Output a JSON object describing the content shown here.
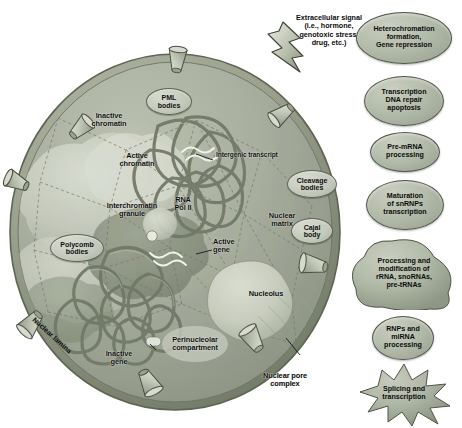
{
  "figure": {
    "background_color": "#ffffff"
  },
  "signal": {
    "icon": "lightning-bolt-icon",
    "text": "Extracellular signal\n(i.e., hormone,\ngenotoxic stress,\ndrug, etc.)"
  },
  "nucleus": {
    "membrane_color": "#8d9584",
    "interior_color": "#a9b09e",
    "labels": [
      {
        "id": "inactive-chromatin",
        "text": "Inactive\nchromatin"
      },
      {
        "id": "active-chromatin",
        "text": "Active\nchromatin"
      },
      {
        "id": "interchromatin-granule",
        "text": "Interchromatin\ngranule"
      },
      {
        "id": "intergenic-transcript",
        "text": "Intergenic transcript"
      },
      {
        "id": "rna-pol-ii",
        "text": "RNA\nPol II"
      },
      {
        "id": "active-gene",
        "text": "Active\ngene"
      },
      {
        "id": "nuclear-matrix",
        "text": "Nuclear\nmatrix"
      },
      {
        "id": "nucleolus",
        "text": "Nucleolus"
      },
      {
        "id": "perinucleolar-compartment",
        "text": "Perinucleolar\ncompartment"
      },
      {
        "id": "inactive-gene",
        "text": "Inactive\ngene"
      },
      {
        "id": "nuclear-lamina",
        "text": "Nuclear lamina"
      },
      {
        "id": "nuclear-pore-complex",
        "text": "Nuclear pore\ncomplex"
      }
    ],
    "bodies": [
      {
        "id": "pml-bodies",
        "text": "PML\nbodies"
      },
      {
        "id": "polycomb-bodies",
        "text": "Polycomb\nbodies"
      },
      {
        "id": "cleavage-bodies",
        "text": "Cleavage\nbodies"
      },
      {
        "id": "cajal-body",
        "text": "Cajal\nbody"
      }
    ]
  },
  "legend": {
    "items": [
      {
        "id": "heterochromatin-formation",
        "shape": "oval",
        "text": "Heterochromation\nformation,\nGene repression"
      },
      {
        "id": "transcription-dna-repair",
        "shape": "oval",
        "text": "Transcription\nDNA repair\napoptosis"
      },
      {
        "id": "pre-mrna-processing",
        "shape": "oval",
        "text": "Pre-mRNA\nprocessing"
      },
      {
        "id": "maturation-snrnps",
        "shape": "oval",
        "text": "Maturation\nof snRNPs\ntranscription"
      },
      {
        "id": "rrna-processing",
        "shape": "blob",
        "text": "Processing and\nmodification of\nrRNA, snoRNAs,\npre-tRNAs"
      },
      {
        "id": "rnps-mirna-processing",
        "shape": "oval",
        "text": "RNPs and\nmiRNA\nprocessing"
      },
      {
        "id": "splicing-transcription",
        "shape": "speckle",
        "text": "Splicing and\ntranscription"
      }
    ]
  }
}
